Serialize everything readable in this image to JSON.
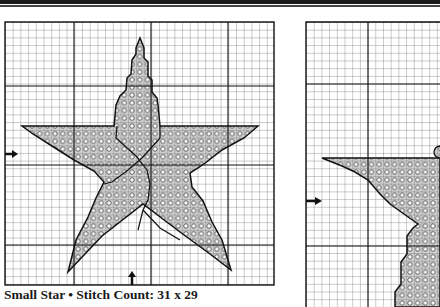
{
  "page": {
    "caption": "Small Star • Stitch Count: 31 x 29"
  },
  "charts": [
    {
      "name": "Small Star",
      "stitch_count": "31 x 29",
      "symbol": "circle-stitch",
      "fill_color": "#cfcfcf"
    },
    {
      "name": "Large Star (partial)",
      "symbol": "circle-stitch",
      "fill_color": "#cfcfcf"
    }
  ],
  "colors": {
    "grid_minor": "#555555",
    "grid_major": "#111111",
    "star_fill": "#d4d4d4",
    "outline": "#111111"
  }
}
